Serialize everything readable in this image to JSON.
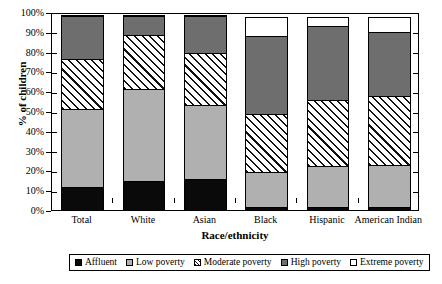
{
  "chart_data": {
    "type": "bar",
    "stacked": true,
    "stack_mode": "percent",
    "title": "",
    "xlabel": "Race/ethnicity",
    "ylabel": "% of children",
    "ylim": [
      0,
      100
    ],
    "yticks": [
      "0%",
      "10%",
      "20%",
      "30%",
      "40%",
      "50%",
      "60%",
      "70%",
      "80%",
      "90%",
      "100%"
    ],
    "ytick_values": [
      0,
      10,
      20,
      30,
      40,
      50,
      60,
      70,
      80,
      90,
      100
    ],
    "grid": false,
    "legend_position": "bottom",
    "categories": [
      "Total",
      "White",
      "Asian",
      "Black",
      "Hispanic",
      "American Indian"
    ],
    "series": [
      {
        "name": "Affluent",
        "key": "affluent",
        "color": "#0a0a0a",
        "fill": "solid-black",
        "values": [
          12,
          15,
          16,
          2,
          2,
          2
        ]
      },
      {
        "name": "Low poverty",
        "key": "low",
        "color": "#b0b0b0",
        "fill": "light-gray",
        "values": [
          40,
          47,
          38,
          18,
          21,
          22
        ]
      },
      {
        "name": "Moderate poverty",
        "key": "moderate",
        "color": "#ffffff",
        "fill": "diagonal-hatch",
        "values": [
          26,
          28,
          27,
          30,
          34,
          35
        ]
      },
      {
        "name": "High poverty",
        "key": "high",
        "color": "#6e6e6e",
        "fill": "dark-gray",
        "values": [
          22,
          10,
          19,
          40,
          38,
          33
        ]
      },
      {
        "name": "Extreme poverty",
        "key": "extreme",
        "color": "#ffffff",
        "fill": "white",
        "values": [
          0,
          0,
          0,
          10,
          5,
          8
        ]
      }
    ]
  },
  "legend": {
    "items": [
      {
        "label": "Affluent",
        "swatch": "affluent"
      },
      {
        "label": "Low poverty",
        "swatch": "low"
      },
      {
        "label": "Moderate poverty",
        "swatch": "moderate"
      },
      {
        "label": "High poverty",
        "swatch": "high"
      },
      {
        "label": "Extreme poverty",
        "swatch": "extreme"
      }
    ]
  }
}
